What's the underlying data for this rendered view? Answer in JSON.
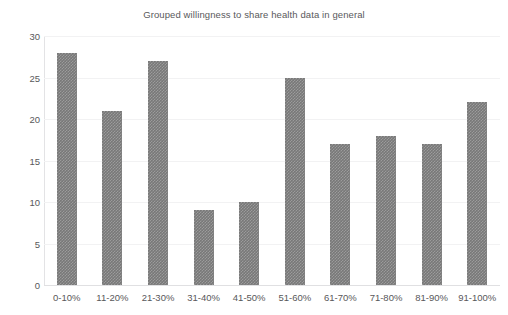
{
  "chart_data": {
    "type": "bar",
    "title": "Grouped willingness to share health data in general",
    "xlabel": "",
    "ylabel": "",
    "categories": [
      "0-10%",
      "11-20%",
      "21-30%",
      "31-40%",
      "41-50%",
      "51-60%",
      "61-70%",
      "71-80%",
      "81-90%",
      "91-100%"
    ],
    "values": [
      28,
      21,
      27,
      9,
      10,
      25,
      17,
      18,
      17,
      22
    ],
    "ylim": [
      0,
      30
    ],
    "yticks": [
      0,
      5,
      10,
      15,
      20,
      25,
      30
    ],
    "ytick_labels": [
      "0",
      "5",
      "10",
      "15",
      "20",
      "25",
      "30"
    ],
    "grid": true,
    "legend": false,
    "bar_color": "#787878",
    "background_color": "#ffffff",
    "text_color": "#58585a"
  }
}
